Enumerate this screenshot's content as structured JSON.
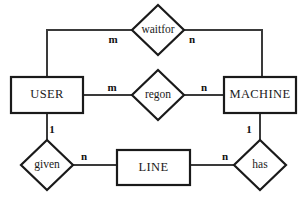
{
  "diagram": {
    "type": "er-diagram",
    "entities": [
      {
        "id": "user",
        "label": "USER",
        "x": 11,
        "y": 77,
        "w": 72,
        "h": 36
      },
      {
        "id": "machine",
        "label": "MACHINE",
        "x": 224,
        "y": 77,
        "w": 72,
        "h": 36
      },
      {
        "id": "line",
        "label": "LINE",
        "x": 117,
        "y": 150,
        "w": 73,
        "h": 35
      }
    ],
    "relationships": [
      {
        "id": "waitfor",
        "label": "waitfor",
        "cx": 158,
        "cy": 30,
        "rx": 26,
        "ry": 25
      },
      {
        "id": "regon",
        "label": "regon",
        "cx": 158,
        "cy": 95,
        "rx": 26,
        "ry": 25
      },
      {
        "id": "given",
        "label": "given",
        "cx": 47,
        "cy": 165,
        "rx": 26,
        "ry": 25
      },
      {
        "id": "has",
        "label": "has",
        "cx": 260,
        "cy": 165,
        "rx": 26,
        "ry": 25
      }
    ],
    "cardinalities": [
      {
        "id": "waitfor-user-card",
        "text": "m",
        "x": 113,
        "y": 40
      },
      {
        "id": "waitfor-machine-card",
        "text": "n",
        "x": 192,
        "y": 40
      },
      {
        "id": "regon-user-card",
        "text": "m",
        "x": 112,
        "y": 88
      },
      {
        "id": "regon-machine-card",
        "text": "n",
        "x": 204,
        "y": 88
      },
      {
        "id": "given-user-card",
        "text": "1",
        "x": 52,
        "y": 130
      },
      {
        "id": "given-line-card",
        "text": "n",
        "x": 84,
        "y": 157
      },
      {
        "id": "has-machine-card",
        "text": "1",
        "x": 249,
        "y": 130
      },
      {
        "id": "has-line-card",
        "text": "n",
        "x": 225,
        "y": 157
      }
    ],
    "connections": [
      {
        "id": "user-to-waitfor",
        "from": "user",
        "to": "waitfor",
        "path": "M 47 77 L 47 30 L 132 30"
      },
      {
        "id": "waitfor-to-machine",
        "from": "waitfor",
        "to": "machine",
        "path": "M 184 30 L 262 30 L 262 77"
      },
      {
        "id": "user-to-regon",
        "from": "user",
        "to": "regon",
        "path": "M 83 95 L 132 95"
      },
      {
        "id": "regon-to-machine",
        "from": "regon",
        "to": "machine",
        "path": "M 184 95 L 224 95"
      },
      {
        "id": "user-to-given",
        "from": "user",
        "to": "given",
        "path": "M 47 113 L 47 140"
      },
      {
        "id": "given-to-line",
        "from": "given",
        "to": "line",
        "path": "M 73 165 L 117 165"
      },
      {
        "id": "line-to-has",
        "from": "line",
        "to": "has",
        "path": "M 190 165 L 234 165"
      },
      {
        "id": "machine-to-has",
        "from": "machine",
        "to": "has",
        "path": "M 260 113 L 260 140"
      }
    ],
    "colors": {
      "background": "#ffffff",
      "shape_stroke": "#1a1a1a",
      "connector_stroke": "#3a3a3a",
      "text": "#1a1a1a"
    }
  }
}
